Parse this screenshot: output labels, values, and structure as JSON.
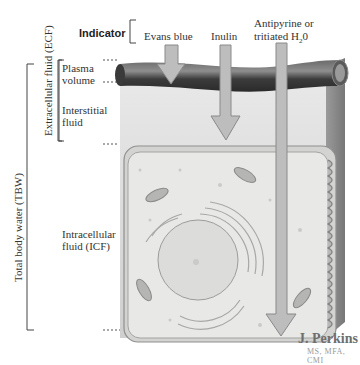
{
  "header": {
    "indicator_label": "Indicator",
    "indicators": [
      {
        "name": "Evans blue",
        "measures": "Plasma volume"
      },
      {
        "name": "Inulin",
        "measures": "Extracellular fluid (ECF)"
      },
      {
        "name_line1": "Antipyrine or",
        "name_line2_prefix": "tritiated H",
        "name_line2_sub": "2",
        "name_line2_suffix": "0",
        "measures": "Total body water (TBW)"
      }
    ]
  },
  "compartments": {
    "tbw": "Total body water (TBW)",
    "ecf": "Extracellular fluid (ECF)",
    "plasma_line1": "Plasma",
    "plasma_line2": "volume",
    "interstitial_line1": "Interstitial",
    "interstitial_line2": "fluid",
    "icf_line1": "Intracellular",
    "icf_line2": "fluid (ICF)"
  },
  "signature": {
    "name": "J. Perkins",
    "credentials": "MS, MFA, CMI"
  },
  "colors": {
    "vessel": "#4a4a4a",
    "arrow_fill": "#bdbdbd",
    "arrow_stroke": "#8a8a8a",
    "interstitial_bg": "#d9d9d9",
    "cell_fill": "#e6e6e4",
    "cell_stroke": "#9a9a9a"
  }
}
